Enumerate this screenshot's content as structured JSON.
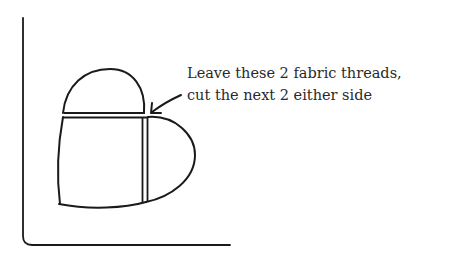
{
  "annotation": {
    "line1": "Leave these 2 fabric threads,",
    "line2": "cut the next 2 either side"
  },
  "colors": {
    "stroke": "#1a1a1a",
    "text": "#2a2a2a",
    "background": "#ffffff"
  },
  "icons": {
    "arrow": "arrow-pointing-to-intersection"
  }
}
